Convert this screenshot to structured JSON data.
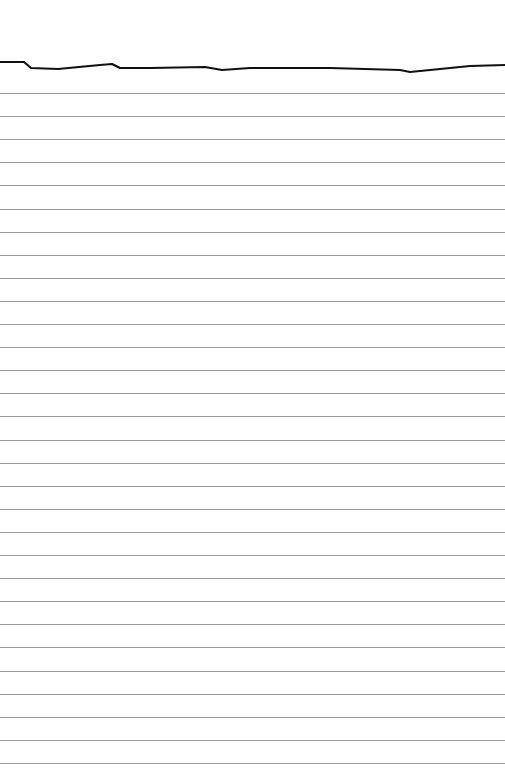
{
  "paper": {
    "type": "lined-paper",
    "background_color": "#fefefe",
    "rule_color": "#9a9a9a",
    "torn_edge_color": "#111111",
    "rule_count": 30,
    "first_rule_y": 93,
    "rule_spacing": 23.1
  }
}
